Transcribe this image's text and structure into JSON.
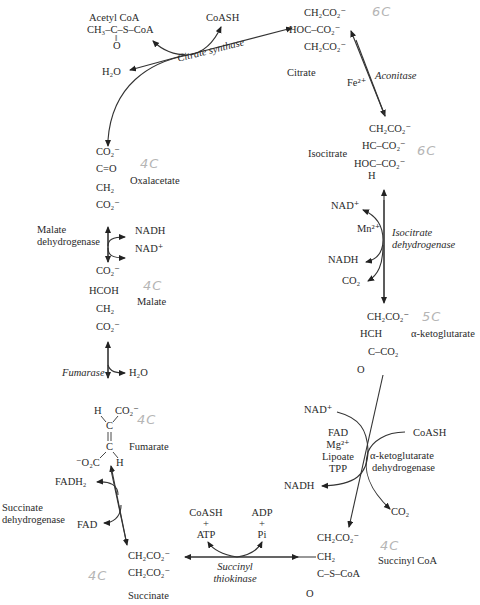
{
  "diagram": {
    "metabolites": {
      "acetyl_coa": {
        "name": "Acetyl CoA",
        "formula_line1": "CH₃–C–S–CoA",
        "formula_line2": "‖",
        "formula_line3": "O"
      },
      "citrate": {
        "name": "Citrate",
        "line1": "CH₂CO₂⁻",
        "line2": "HOC–CO₂⁻",
        "line3": "CH₂CO₂⁻",
        "note": "6C"
      },
      "isocitrate": {
        "name": "Isocitrate",
        "line1": "CH₂CO₂⁻",
        "line2": "HC–CO₂⁻",
        "line3": "HOC–CO₂⁻",
        "line4": "H",
        "note": "6C"
      },
      "alpha_ketoglutarate": {
        "name": "α-ketoglutarate",
        "line1": "CH₂CO₂⁻",
        "line2": "HCH",
        "line3": "C–CO₂",
        "line4": "O",
        "note": "5C"
      },
      "succinyl_coa": {
        "name": "Succinyl CoA",
        "line1": "CH₂CO₂⁻",
        "line2": "CH₂",
        "line3": "C–S–CoA",
        "line4": "O",
        "note": "4C"
      },
      "succinate": {
        "name": "Succinate",
        "line1": "CH₂CO₂⁻",
        "line2": "CH₂CO₂⁻",
        "note": "4C"
      },
      "fumarate": {
        "name": "Fumarate",
        "line1a": "H",
        "line1b": "CO₂⁻",
        "line2": "C",
        "line3": "C",
        "line4a": "⁻O₂C",
        "line4b": "H",
        "note": "4C"
      },
      "malate": {
        "name": "Malate",
        "line1": "CO₂⁻",
        "line2": "HCOH",
        "line3": "CH₂",
        "line4": "CO₂⁻",
        "note": "4C"
      },
      "oxalacetate": {
        "name": "Oxalacetate",
        "line1": "CO₂⁻",
        "line2": "C=O",
        "line3": "CH₂",
        "line4": "CO₂⁻",
        "note": "4C"
      }
    },
    "enzymes": {
      "citrate_synthase": "Citrate synthase",
      "aconitase": "Aconitase",
      "isocitrate_dh_1": "Isocitrate",
      "isocitrate_dh_2": "dehydrogenase",
      "akg_dh_1": "α-ketoglutarate",
      "akg_dh_2": "dehydrogenase",
      "succinyl_thiokinase_1": "Succinyl",
      "succinyl_thiokinase_2": "thiokinase",
      "succinate_dh_1": "Succinate",
      "succinate_dh_2": "dehydrogenase",
      "fumarase": "Fumarase",
      "malate_dh_1": "Malate",
      "malate_dh_2": "dehydrogenase"
    },
    "cofactors": {
      "coash_top": "CoASH",
      "h2o_top": "H₂O",
      "fe": "Fe²⁺",
      "nad_iso": "NAD⁺",
      "mn": "Mn²⁺",
      "nadh_iso": "NADH",
      "co2_iso": "CO₂",
      "nad_akg": "NAD⁺",
      "fad_akg": "FAD",
      "mg_akg": "Mg²⁺",
      "lipoate_akg": "Lipoate",
      "tpp_akg": "TPP",
      "coash_akg": "CoASH",
      "nadh_akg": "NADH",
      "co2_akg": "CO₂",
      "coash_st": "CoASH",
      "plus1": "+",
      "atp_st": "ATP",
      "adp_st": "ADP",
      "plus2": "+",
      "pi_st": "Pi",
      "fadh2": "FADH₂",
      "fad": "FAD",
      "h2o_fum": "H₂O",
      "nadh_mal": "NADH",
      "nad_mal": "NAD⁺"
    }
  }
}
